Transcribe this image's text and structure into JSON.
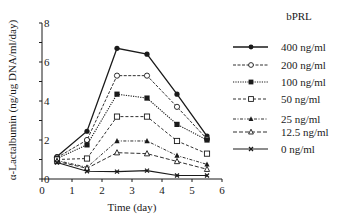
{
  "chart_data": {
    "type": "line",
    "title": "",
    "xlabel": "Time (day)",
    "ylabel": "α-Lactalbumin (ng/ug DNA/ml/day)",
    "xlim": [
      0,
      6
    ],
    "ylim": [
      0,
      8
    ],
    "xticks": [
      0,
      1,
      2,
      3,
      4,
      5,
      6
    ],
    "yticks": [
      0,
      2,
      4,
      6,
      8
    ],
    "grid": false,
    "legend_title": "bPRL",
    "legend_position": "right",
    "x": [
      0.5,
      1.5,
      2.5,
      3.5,
      4.5,
      5.5
    ],
    "series": [
      {
        "name": "400 ng/ml",
        "marker": "filled-circle",
        "dash": "solid",
        "width": 1.3,
        "values": [
          1.15,
          2.45,
          6.7,
          6.4,
          4.35,
          2.2
        ]
      },
      {
        "name": "200 ng/ml",
        "marker": "open-circle",
        "dash": "3,1.5",
        "width": 0.9,
        "values": [
          1.1,
          2.0,
          5.3,
          5.3,
          3.7,
          2.05
        ]
      },
      {
        "name": "100 ng/ml",
        "marker": "filled-square",
        "dash": "1.2,1.2",
        "width": 1.1,
        "values": [
          1.05,
          1.75,
          4.35,
          4.15,
          2.8,
          2.0
        ]
      },
      {
        "name": "50 ng/ml",
        "marker": "open-square",
        "dash": "3,2",
        "width": 0.9,
        "values": [
          1.0,
          1.05,
          3.2,
          3.2,
          1.95,
          1.3
        ]
      },
      {
        "name": "25 ng/ml",
        "marker": "filled-triangle",
        "dash": "3,1.5,1,1.5",
        "width": 0.9,
        "values": [
          0.95,
          0.6,
          1.95,
          1.95,
          1.2,
          0.75
        ]
      },
      {
        "name": "12.5 ng/ml",
        "marker": "open-triangle",
        "dash": "4,2",
        "width": 0.9,
        "values": [
          0.9,
          0.55,
          1.35,
          1.3,
          0.9,
          0.5
        ]
      },
      {
        "name": "0 ng/ml",
        "marker": "x-cross",
        "dash": "solid",
        "width": 1.1,
        "values": [
          0.85,
          0.4,
          0.38,
          0.43,
          0.18,
          0.18
        ]
      }
    ]
  },
  "labels": {
    "xlabel": "Time (day)",
    "ylabel": "α-Lactalbumin (ng/ug DNA/ml/day)",
    "legend_title": "bPRL"
  },
  "colors": {
    "ink": "#1a1a1a",
    "background": "#ffffff"
  }
}
